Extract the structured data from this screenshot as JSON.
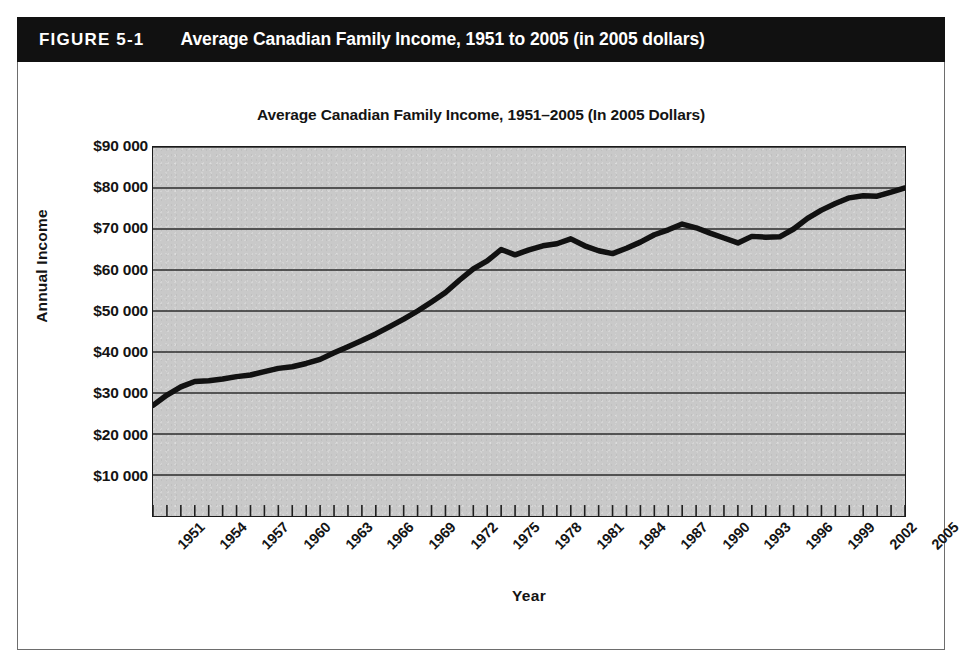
{
  "figure": {
    "label": "FIGURE 5-1",
    "caption": "Average Canadian Family Income, 1951 to 2005 (in 2005 dollars)"
  },
  "chart_data": {
    "type": "line",
    "title": "Average Canadian Family Income, 1951–2005 (In 2005 Dollars)",
    "xlabel": "Year",
    "ylabel": "Annual Income",
    "xlim": [
      1951,
      2005
    ],
    "ylim": [
      0,
      90000
    ],
    "grid": true,
    "legend_position": "none",
    "ytick_labels": [
      "$90 000",
      "$80 000",
      "$70 000",
      "$60 000",
      "$50 000",
      "$40 000",
      "$30 000",
      "$20 000",
      "$10 000"
    ],
    "ytick_values": [
      90000,
      80000,
      70000,
      60000,
      50000,
      40000,
      30000,
      20000,
      10000
    ],
    "xtick_labels": [
      "1951",
      "1954",
      "1957",
      "1960",
      "1963",
      "1966",
      "1969",
      "1972",
      "1975",
      "1978",
      "1981",
      "1984",
      "1987",
      "1990",
      "1993",
      "1996",
      "1999",
      "2002",
      "2005"
    ],
    "xtick_interval_years": 3,
    "minor_tick_interval_years": 1,
    "series": [
      {
        "name": "Average Canadian family income (2005 dollars)",
        "color": "#111111",
        "x": [
          1951,
          1952,
          1953,
          1954,
          1955,
          1956,
          1957,
          1958,
          1959,
          1960,
          1961,
          1962,
          1963,
          1964,
          1965,
          1966,
          1967,
          1968,
          1969,
          1970,
          1971,
          1972,
          1973,
          1974,
          1975,
          1976,
          1977,
          1978,
          1979,
          1980,
          1981,
          1982,
          1983,
          1984,
          1985,
          1986,
          1987,
          1988,
          1989,
          1990,
          1991,
          1992,
          1993,
          1994,
          1995,
          1996,
          1997,
          1998,
          1999,
          2000,
          2001,
          2002,
          2003,
          2004,
          2005
        ],
        "values": [
          27000,
          29500,
          31500,
          32800,
          33000,
          33400,
          34000,
          34400,
          35200,
          36000,
          36400,
          37200,
          38200,
          39800,
          41300,
          42800,
          44400,
          46200,
          48000,
          50000,
          52200,
          54500,
          57500,
          60300,
          62200,
          65000,
          63700,
          64900,
          65900,
          66400,
          67600,
          65900,
          64700,
          64000,
          65300,
          66800,
          68600,
          69800,
          71200,
          70300,
          69000,
          67800,
          66600,
          68200,
          68000,
          68100,
          70000,
          72600,
          74600,
          76200,
          77600,
          78100,
          78000,
          79000,
          80000
        ]
      }
    ]
  }
}
